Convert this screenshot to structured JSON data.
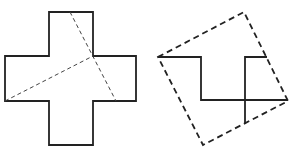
{
  "figures": [
    {
      "name": "cross-with-cut-lines",
      "outline": "49,12 93,12 93,56 136,56 136,101 93,101 93,145 49,145 49,101 5,101 5,56 49,56",
      "cuts": [
        {
          "x1": 70,
          "y1": 12,
          "x2": 116,
          "y2": 101
        },
        {
          "x1": 5,
          "y1": 101,
          "x2": 93,
          "y2": 56
        }
      ]
    },
    {
      "name": "rearranged-square",
      "square": "158,57 244,12 288,101 203,145",
      "solid_paths": [
        "158,57 201,57 201,100 288,100",
        "267,57 245,57 245,124"
      ]
    }
  ],
  "colors": {
    "stroke": "#222222",
    "dash": "#333333"
  }
}
